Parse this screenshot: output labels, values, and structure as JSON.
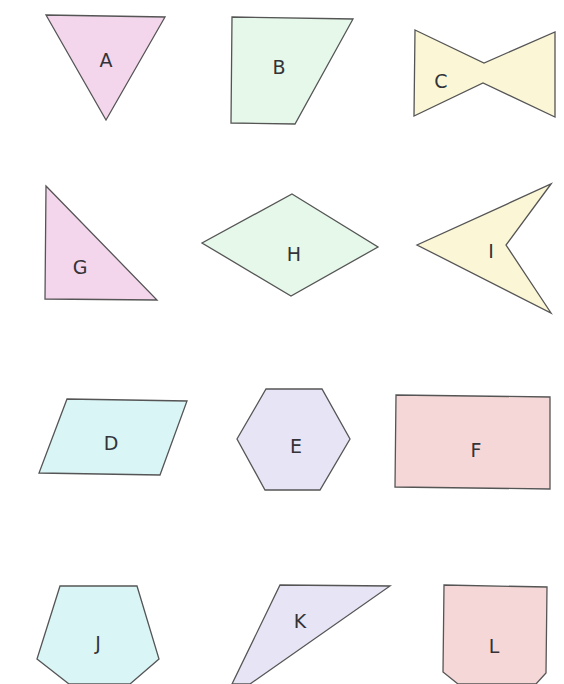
{
  "colors": {
    "pink": "#f4d6ec",
    "mint": "#e5f8ea",
    "cream": "#fbf7d6",
    "cyan": "#d9f5f6",
    "lavender": "#e7e5f5",
    "rose": "#f4d7d6",
    "stroke": "#555555",
    "label": "#333338"
  },
  "shapes": [
    {
      "label": "A",
      "name": "inverted-triangle",
      "fill": "#f4d6ec",
      "points": "46,15 165,17 106,120",
      "lx": 106,
      "ly": 61
    },
    {
      "label": "B",
      "name": "right-trapezoid",
      "fill": "#e5f8ea",
      "points": "232,17 353,19 295,124 231,123",
      "lx": 279,
      "ly": 68
    },
    {
      "label": "C",
      "name": "bowtie",
      "fill": "#fbf7d6",
      "points": "415,30 484,63 555,32 555,117 483,83 414,116",
      "lx": 441,
      "ly": 82
    },
    {
      "label": "G",
      "name": "right-triangle",
      "fill": "#f4d6ec",
      "points": "46,186 157,300 45,299",
      "lx": 80,
      "ly": 268
    },
    {
      "label": "H",
      "name": "rhombus",
      "fill": "#e5f8ea",
      "points": "292,194 378,247 291,296 202,243",
      "lx": 294,
      "ly": 255
    },
    {
      "label": "I",
      "name": "arrowhead-dart",
      "fill": "#fbf7d6",
      "points": "551,184 506,245 551,313 417,245",
      "lx": 491,
      "ly": 252
    },
    {
      "label": "D",
      "name": "parallelogram",
      "fill": "#d9f5f6",
      "points": "67,399 187,401 160,475 39,473",
      "lx": 111,
      "ly": 444
    },
    {
      "label": "E",
      "name": "hexagon",
      "fill": "#e7e5f5",
      "points": "266,389 322,389 350,439 320,490 265,490 237,439",
      "lx": 296,
      "ly": 447
    },
    {
      "label": "F",
      "name": "rectangle",
      "fill": "#f4d7d6",
      "points": "396,395 550,397 550,489 395,487",
      "lx": 476,
      "ly": 451
    },
    {
      "label": "J",
      "name": "pentagon",
      "fill": "#d9f5f6",
      "points": "60,586 137,586 159,659 130,684 69,684 37,659",
      "lx": 98,
      "ly": 644
    },
    {
      "label": "K",
      "name": "obtuse-triangle",
      "fill": "#e7e5f5",
      "points": "280,585 390,586 250,684 232,684",
      "lx": 300,
      "ly": 622
    },
    {
      "label": "L",
      "name": "pointed-pentagon",
      "fill": "#f4d7d6",
      "points": "444,585 547,587 546,673 536,684 458,684 443,672",
      "lx": 494,
      "ly": 647
    }
  ]
}
